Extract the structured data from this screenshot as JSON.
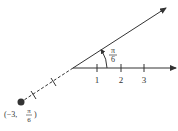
{
  "diagram": {
    "colors": {
      "line": "#333333",
      "point": "#333333",
      "background": "#ffffff"
    },
    "polar_axis": {
      "tick_labels": [
        "1",
        "2",
        "3"
      ]
    },
    "angle": {
      "label_num": "π",
      "label_den": "6",
      "value": "π/6"
    },
    "point": {
      "label_prefix": "(−3, ",
      "label_num": "π",
      "label_den": "6",
      "label_suffix": ")",
      "r": -3,
      "theta": "π/6"
    }
  }
}
